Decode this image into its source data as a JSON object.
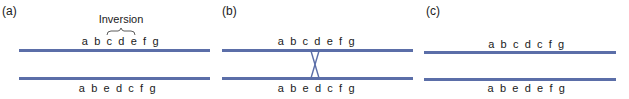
{
  "figure": {
    "line_color": "#5b6ea8",
    "panels": [
      {
        "label": "(a)",
        "top_sequence": "abcdefg",
        "bottom_sequence": "abedcfg",
        "annotation": "Inversion",
        "bracket_spans": "cde"
      },
      {
        "label": "(b)",
        "top_sequence": "abcdefg",
        "bottom_sequence": "abedcfg",
        "feature": "crossover between homologs"
      },
      {
        "label": "(c)",
        "top_sequence": "abcdcfg",
        "bottom_sequence": "abedefg"
      }
    ]
  }
}
